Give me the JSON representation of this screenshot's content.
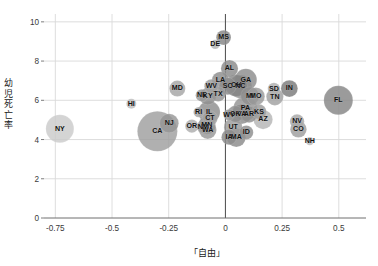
{
  "chart_data": {
    "type": "scatter",
    "title": "",
    "subtitle": "",
    "xlabel": "「自由」",
    "ylabel": "幼児死亡率",
    "xlim": [
      -0.8,
      0.62
    ],
    "ylim": [
      0,
      10.4
    ],
    "xticks": [
      -0.75,
      -0.5,
      -0.25,
      0,
      0.25,
      0.5
    ],
    "xticklabels": [
      "-0.75",
      "-0.5",
      "-0.25",
      "0",
      "0.25",
      "0.5"
    ],
    "yticks": [
      0,
      2,
      4,
      6,
      8,
      10
    ],
    "yticklabels": [
      "0",
      "2",
      "4",
      "6",
      "8",
      "10"
    ],
    "grid": true,
    "legend": "none",
    "size_meaning": "bubble area proportional to state population",
    "points": [
      {
        "label": "NY",
        "x": -0.73,
        "y": 4.55,
        "r": 14.0,
        "color": "#c9c9c9",
        "opacity": 0.8
      },
      {
        "label": "HI",
        "x": -0.415,
        "y": 5.82,
        "r": 5.0,
        "color": "#bdbdbd",
        "opacity": 0.85
      },
      {
        "label": "CA",
        "x": -0.3,
        "y": 4.42,
        "r": 20.0,
        "color": "#9c9c9c",
        "opacity": 0.8
      },
      {
        "label": "NJ",
        "x": -0.248,
        "y": 4.83,
        "r": 9.5,
        "color": "#949494",
        "opacity": 0.8
      },
      {
        "label": "MD",
        "x": -0.212,
        "y": 6.6,
        "r": 8.0,
        "color": "#a8a8a8",
        "opacity": 0.85
      },
      {
        "label": "DE",
        "x": -0.045,
        "y": 8.85,
        "r": 4.6,
        "color": "#b5b5b5",
        "opacity": 0.85
      },
      {
        "label": "MS",
        "x": -0.008,
        "y": 9.2,
        "r": 7.4,
        "color": "#8a8a8a",
        "opacity": 0.85
      },
      {
        "label": "AL",
        "x": 0.018,
        "y": 7.62,
        "r": 8.6,
        "color": "#8e8e8e",
        "opacity": 0.85
      },
      {
        "label": "LA",
        "x": -0.022,
        "y": 7.02,
        "r": 8.6,
        "color": "#909090",
        "opacity": 0.85
      },
      {
        "label": "GA",
        "x": 0.09,
        "y": 7.05,
        "r": 11.0,
        "color": "#8c8c8c",
        "opacity": 0.82
      },
      {
        "label": "WV",
        "x": -0.062,
        "y": 6.72,
        "r": 7.0,
        "color": "#a0a0a0",
        "opacity": 0.85
      },
      {
        "label": "SC",
        "x": 0.01,
        "y": 6.72,
        "r": 8.6,
        "color": "#8d8d8d",
        "opacity": 0.85
      },
      {
        "label": "OH",
        "x": 0.048,
        "y": 6.75,
        "r": 11.0,
        "color": "#848484",
        "opacity": 0.82
      },
      {
        "label": "NC",
        "x": 0.066,
        "y": 6.7,
        "r": 11.5,
        "color": "#8b8b8b",
        "opacity": 0.8
      },
      {
        "label": "NE",
        "x": -0.104,
        "y": 6.25,
        "r": 6.2,
        "color": "#9a9a9a",
        "opacity": 0.85
      },
      {
        "label": "KY",
        "x": -0.078,
        "y": 6.2,
        "r": 8.4,
        "color": "#909090",
        "opacity": 0.85
      },
      {
        "label": "TX",
        "x": -0.032,
        "y": 6.32,
        "r": 7.4,
        "color": "#979797",
        "opacity": 0.85
      },
      {
        "label": "MI",
        "x": 0.108,
        "y": 6.22,
        "r": 9.2,
        "color": "#8f8f8f",
        "opacity": 0.82
      },
      {
        "label": "MO",
        "x": 0.134,
        "y": 6.2,
        "r": 9.0,
        "color": "#9a9a9a",
        "opacity": 0.82
      },
      {
        "label": "SD",
        "x": 0.214,
        "y": 6.58,
        "r": 6.2,
        "color": "#b2b2b2",
        "opacity": 0.85
      },
      {
        "label": "TN",
        "x": 0.218,
        "y": 6.18,
        "r": 8.6,
        "color": "#a3a3a3",
        "opacity": 0.85
      },
      {
        "label": "IN",
        "x": 0.282,
        "y": 6.6,
        "r": 8.4,
        "color": "#7f7f7f",
        "opacity": 0.85
      },
      {
        "label": "FL",
        "x": 0.498,
        "y": 6.0,
        "r": 14.5,
        "color": "#8a8a8a",
        "opacity": 0.85
      },
      {
        "label": "RI",
        "x": -0.118,
        "y": 5.4,
        "r": 5.2,
        "color": "#a6a6a6",
        "opacity": 0.85
      },
      {
        "label": "IL",
        "x": -0.072,
        "y": 5.4,
        "r": 11.0,
        "color": "#8b8b8b",
        "opacity": 0.8
      },
      {
        "label": "CT",
        "x": -0.068,
        "y": 5.08,
        "r": 7.6,
        "color": "#a2a2a2",
        "opacity": 0.85
      },
      {
        "label": "PA",
        "x": 0.088,
        "y": 5.58,
        "r": 12.0,
        "color": "#909090",
        "opacity": 0.8
      },
      {
        "label": "WY",
        "x": 0.016,
        "y": 5.26,
        "r": 5.6,
        "color": "#999999",
        "opacity": 0.85
      },
      {
        "label": "OK",
        "x": 0.044,
        "y": 5.3,
        "r": 8.2,
        "color": "#8d8d8d",
        "opacity": 0.82
      },
      {
        "label": "VA",
        "x": 0.072,
        "y": 5.3,
        "r": 10.0,
        "color": "#8a8a8a",
        "opacity": 0.8
      },
      {
        "label": "AR",
        "x": 0.104,
        "y": 5.28,
        "r": 8.2,
        "color": "#8f8f8f",
        "opacity": 0.82
      },
      {
        "label": "KS",
        "x": 0.148,
        "y": 5.42,
        "r": 7.4,
        "color": "#9e9e9e",
        "opacity": 0.85
      },
      {
        "label": "AZ",
        "x": 0.166,
        "y": 5.02,
        "r": 9.6,
        "color": "#b4b4b4",
        "opacity": 0.82
      },
      {
        "label": "OR",
        "x": -0.148,
        "y": 4.68,
        "r": 6.6,
        "color": "#b0b0b0",
        "opacity": 0.85
      },
      {
        "label": "NM",
        "x": -0.098,
        "y": 4.64,
        "r": 6.4,
        "color": "#9d9d9d",
        "opacity": 0.85
      },
      {
        "label": "MN",
        "x": -0.082,
        "y": 4.72,
        "r": 8.8,
        "color": "#8e8e8e",
        "opacity": 0.82
      },
      {
        "label": "WA",
        "x": -0.078,
        "y": 4.48,
        "r": 8.8,
        "color": "#979797",
        "opacity": 0.82
      },
      {
        "label": "UT",
        "x": 0.034,
        "y": 4.62,
        "r": 9.2,
        "color": "#9b9b9b",
        "opacity": 0.82
      },
      {
        "label": "ID",
        "x": 0.092,
        "y": 4.36,
        "r": 7.0,
        "color": "#909090",
        "opacity": 0.85
      },
      {
        "label": "IA",
        "x": 0.016,
        "y": 4.12,
        "r": 7.6,
        "color": "#8c8c8c",
        "opacity": 0.85
      },
      {
        "label": "MA",
        "x": 0.048,
        "y": 4.1,
        "r": 9.4,
        "color": "#8a8a8a",
        "opacity": 0.82
      },
      {
        "label": "NV",
        "x": 0.316,
        "y": 4.92,
        "r": 7.2,
        "color": "#a9a9a9",
        "opacity": 0.85
      },
      {
        "label": "CO",
        "x": 0.322,
        "y": 4.52,
        "r": 8.2,
        "color": "#a1a1a1",
        "opacity": 0.85
      },
      {
        "label": "NH",
        "x": 0.372,
        "y": 3.92,
        "r": 4.2,
        "color": "#bdbdbd",
        "opacity": 0.85
      }
    ]
  },
  "colors": {
    "grid": "#d9d9d9",
    "axis": "#6e6e6e",
    "zero_line": "#4a4a4a",
    "text": "#2b2b2b",
    "background": "#ffffff"
  }
}
